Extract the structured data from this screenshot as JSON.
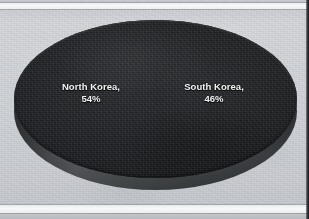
{
  "chart_data": {
    "type": "pie",
    "title": "",
    "subtitle": "",
    "xlabel": "",
    "ylabel": "",
    "three_d": true,
    "grid": false,
    "legend_position": "none",
    "labels_position": "inside-slice",
    "categories": [
      "North Korea",
      "South Korea"
    ],
    "values": [
      54,
      46
    ],
    "value_unit": "%",
    "slices": [
      {
        "name": "North Korea",
        "value": 54,
        "label_line1": "North Korea,",
        "label_line2": "54%",
        "color": "#232528",
        "label_color": "#f2f3f4",
        "position": "left"
      },
      {
        "name": "South Korea",
        "value": 46,
        "label_line1": "South Korea,",
        "label_line2": "46%",
        "color": "#212326",
        "label_color": "#f2f3f4",
        "position": "right"
      }
    ]
  },
  "colors": {
    "background": "#d2d5d9",
    "band": "#f6f7f8",
    "pie_top": "#242628",
    "pie_side": "#3a3d40",
    "right_rule": "#17181a",
    "label_text": "#f2f3f4"
  },
  "icons": {
    "pie_chart": "pie-chart-icon"
  }
}
